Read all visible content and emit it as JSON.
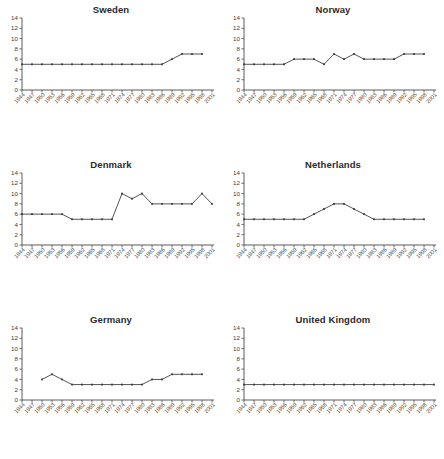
{
  "figure": {
    "panel_count": 6,
    "line_color": "#4b4b4b",
    "axis_color": "#4a4a4a",
    "background": "#ffffff"
  },
  "x_categories": [
    "1944",
    "1947",
    "1950",
    "1953",
    "1956",
    "1959",
    "1962",
    "1965",
    "1968",
    "1971",
    "1974",
    "1977",
    "1980",
    "1983",
    "1986",
    "1989",
    "1992",
    "1995",
    "1998",
    "2001"
  ],
  "y_ticks": [
    "0",
    "2",
    "4",
    "6",
    "8",
    "10",
    "12",
    "14"
  ],
  "chart_data": [
    {
      "type": "line",
      "title": "Sweden",
      "xlabel": "",
      "ylabel": "",
      "ylim": [
        0,
        14
      ],
      "grid": false,
      "legend": "none",
      "categories": [
        "1944",
        "1947",
        "1950",
        "1953",
        "1956",
        "1959",
        "1962",
        "1965",
        "1968",
        "1971",
        "1974",
        "1977",
        "1980",
        "1983",
        "1986",
        "1989",
        "1992",
        "1995",
        "1998"
      ],
      "values": [
        5,
        5,
        5,
        5,
        5,
        5,
        5,
        5,
        5,
        5,
        5,
        5,
        5,
        5,
        5,
        6,
        7,
        7,
        7
      ]
    },
    {
      "type": "line",
      "title": "Norway",
      "xlabel": "",
      "ylabel": "",
      "ylim": [
        0,
        14
      ],
      "grid": false,
      "legend": "none",
      "categories": [
        "1944",
        "1947",
        "1950",
        "1953",
        "1956",
        "1959",
        "1962",
        "1965",
        "1968",
        "1971",
        "1974",
        "1977",
        "1980",
        "1983",
        "1986",
        "1989",
        "1992",
        "1995",
        "1998"
      ],
      "values": [
        5,
        5,
        5,
        5,
        5,
        6,
        6,
        6,
        5,
        7,
        6,
        7,
        6,
        6,
        6,
        6,
        7,
        7,
        7
      ]
    },
    {
      "type": "line",
      "title": "Denmark",
      "xlabel": "",
      "ylabel": "",
      "ylim": [
        0,
        14
      ],
      "grid": false,
      "legend": "none",
      "categories": [
        "1944",
        "1947",
        "1950",
        "1953",
        "1956",
        "1959",
        "1962",
        "1965",
        "1968",
        "1971",
        "1974",
        "1977",
        "1980",
        "1983",
        "1986",
        "1989",
        "1992",
        "1995",
        "1998",
        "2001"
      ],
      "values": [
        6,
        6,
        6,
        6,
        6,
        5,
        5,
        5,
        5,
        5,
        10,
        9,
        10,
        8,
        8,
        8,
        8,
        8,
        10,
        8
      ]
    },
    {
      "type": "line",
      "title": "Netherlands",
      "xlabel": "",
      "ylabel": "",
      "ylim": [
        0,
        14
      ],
      "grid": false,
      "legend": "none",
      "categories": [
        "1944",
        "1947",
        "1950",
        "1953",
        "1956",
        "1959",
        "1962",
        "1965",
        "1968",
        "1971",
        "1974",
        "1977",
        "1980",
        "1983",
        "1986",
        "1989",
        "1992",
        "1995",
        "1998"
      ],
      "values": [
        5,
        5,
        5,
        5,
        5,
        5,
        5,
        6,
        7,
        8,
        8,
        7,
        6,
        5,
        5,
        5,
        5,
        5,
        5
      ]
    },
    {
      "type": "line",
      "title": "Germany",
      "xlabel": "",
      "ylabel": "",
      "ylim": [
        0,
        14
      ],
      "grid": false,
      "legend": "none",
      "categories": [
        "1950",
        "1953",
        "1956",
        "1959",
        "1962",
        "1965",
        "1968",
        "1971",
        "1974",
        "1977",
        "1980",
        "1983",
        "1986",
        "1989",
        "1992",
        "1995",
        "1998"
      ],
      "values": [
        4,
        5,
        4,
        3,
        3,
        3,
        3,
        3,
        3,
        3,
        3,
        4,
        4,
        5,
        5,
        5,
        5
      ]
    },
    {
      "type": "line",
      "title": "United Kingdom",
      "xlabel": "",
      "ylabel": "",
      "ylim": [
        0,
        14
      ],
      "grid": false,
      "legend": "none",
      "categories": [
        "1944",
        "1947",
        "1950",
        "1953",
        "1956",
        "1959",
        "1962",
        "1965",
        "1968",
        "1971",
        "1974",
        "1977",
        "1980",
        "1983",
        "1986",
        "1989",
        "1992",
        "1995",
        "1998",
        "2001"
      ],
      "values": [
        3,
        3,
        3,
        3,
        3,
        3,
        3,
        3,
        3,
        3,
        3,
        3,
        3,
        3,
        3,
        3,
        3,
        3,
        3,
        3
      ]
    }
  ]
}
